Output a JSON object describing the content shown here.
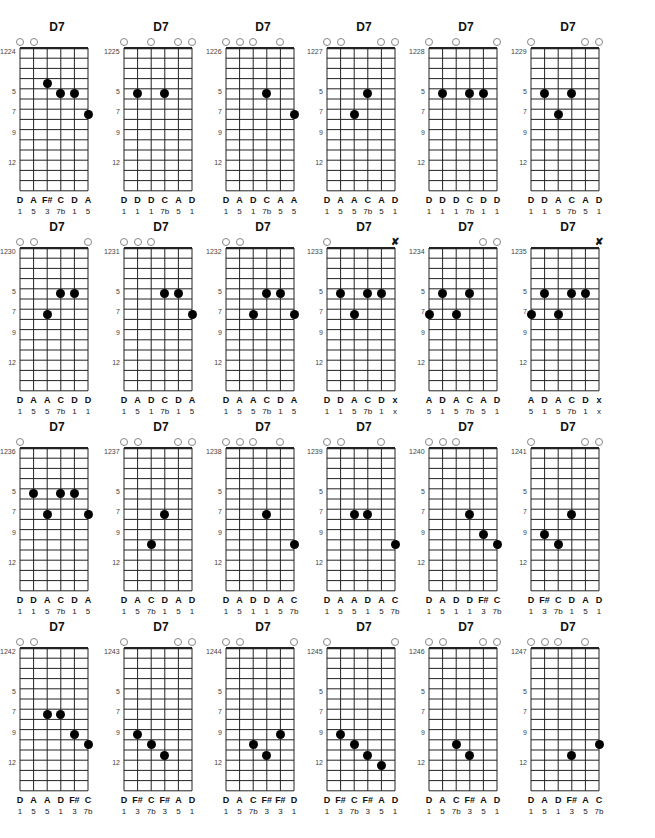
{
  "header": {
    "title": ""
  },
  "layout": {
    "columns_x": [
      30,
      134,
      236,
      337,
      439,
      541
    ],
    "rows_y": [
      20,
      220,
      420,
      620
    ],
    "string_spacing": 13.6,
    "fret_height": 10.2,
    "fret_rows": 14,
    "fret_markers": [
      5,
      7,
      9,
      12
    ]
  },
  "chords": [
    {
      "id": "1224",
      "name": "D7",
      "open": [
        1,
        2
      ],
      "muted": [],
      "dots": [
        {
          "s": 3,
          "f": 4
        },
        {
          "s": 4,
          "f": 5
        },
        {
          "s": 5,
          "f": 5
        },
        {
          "s": 6,
          "f": 7
        }
      ],
      "notes": [
        "D",
        "A",
        "F#",
        "C",
        "D",
        "A"
      ],
      "degrees": [
        "1",
        "5",
        "3",
        "7b",
        "1",
        "5"
      ]
    },
    {
      "id": "1225",
      "name": "D7",
      "open": [
        1,
        3,
        5,
        6
      ],
      "muted": [],
      "dots": [
        {
          "s": 2,
          "f": 5
        },
        {
          "s": 4,
          "f": 5
        }
      ],
      "notes": [
        "D",
        "D",
        "D",
        "C",
        "A",
        "D"
      ],
      "degrees": [
        "1",
        "1",
        "1",
        "7b",
        "5",
        "1"
      ]
    },
    {
      "id": "1226",
      "name": "D7",
      "open": [
        1,
        2,
        3,
        5
      ],
      "muted": [],
      "dots": [
        {
          "s": 4,
          "f": 5
        },
        {
          "s": 6,
          "f": 7
        }
      ],
      "notes": [
        "D",
        "A",
        "D",
        "C",
        "A",
        "A"
      ],
      "degrees": [
        "1",
        "5",
        "1",
        "7b",
        "5",
        "5"
      ]
    },
    {
      "id": "1227",
      "name": "D7",
      "open": [
        1,
        2,
        5,
        6
      ],
      "muted": [],
      "dots": [
        {
          "s": 4,
          "f": 5
        },
        {
          "s": 3,
          "f": 7
        }
      ],
      "notes": [
        "D",
        "A",
        "A",
        "C",
        "A",
        "D"
      ],
      "degrees": [
        "1",
        "5",
        "5",
        "7b",
        "5",
        "1"
      ]
    },
    {
      "id": "1228",
      "name": "D7",
      "open": [
        1,
        3,
        6
      ],
      "muted": [],
      "dots": [
        {
          "s": 2,
          "f": 5
        },
        {
          "s": 4,
          "f": 5
        },
        {
          "s": 5,
          "f": 5
        }
      ],
      "notes": [
        "D",
        "D",
        "D",
        "C",
        "D",
        "D"
      ],
      "degrees": [
        "1",
        "1",
        "1",
        "7b",
        "1",
        "1"
      ]
    },
    {
      "id": "1229",
      "name": "D7",
      "open": [
        1,
        5,
        6
      ],
      "muted": [],
      "dots": [
        {
          "s": 2,
          "f": 5
        },
        {
          "s": 4,
          "f": 5
        },
        {
          "s": 3,
          "f": 7
        }
      ],
      "notes": [
        "D",
        "D",
        "A",
        "C",
        "A",
        "D"
      ],
      "degrees": [
        "1",
        "1",
        "5",
        "7b",
        "5",
        "1"
      ]
    },
    {
      "id": "1230",
      "name": "D7",
      "open": [
        1,
        2,
        6
      ],
      "muted": [],
      "dots": [
        {
          "s": 4,
          "f": 5
        },
        {
          "s": 5,
          "f": 5
        },
        {
          "s": 3,
          "f": 7
        }
      ],
      "notes": [
        "D",
        "A",
        "A",
        "C",
        "D",
        "D"
      ],
      "degrees": [
        "1",
        "5",
        "5",
        "7b",
        "1",
        "1"
      ]
    },
    {
      "id": "1231",
      "name": "D7",
      "open": [
        1,
        2,
        3
      ],
      "muted": [],
      "dots": [
        {
          "s": 4,
          "f": 5
        },
        {
          "s": 5,
          "f": 5
        },
        {
          "s": 6,
          "f": 7
        }
      ],
      "notes": [
        "D",
        "A",
        "D",
        "C",
        "D",
        "A"
      ],
      "degrees": [
        "1",
        "5",
        "1",
        "7b",
        "1",
        "5"
      ]
    },
    {
      "id": "1232",
      "name": "D7",
      "open": [
        1,
        2
      ],
      "muted": [],
      "dots": [
        {
          "s": 4,
          "f": 5
        },
        {
          "s": 5,
          "f": 5
        },
        {
          "s": 3,
          "f": 7
        },
        {
          "s": 6,
          "f": 7
        }
      ],
      "notes": [
        "D",
        "A",
        "A",
        "C",
        "D",
        "A"
      ],
      "degrees": [
        "1",
        "5",
        "5",
        "7b",
        "1",
        "5"
      ]
    },
    {
      "id": "1233",
      "name": "D7",
      "open": [
        1
      ],
      "muted": [
        6
      ],
      "dots": [
        {
          "s": 2,
          "f": 5
        },
        {
          "s": 4,
          "f": 5
        },
        {
          "s": 5,
          "f": 5
        },
        {
          "s": 3,
          "f": 7
        }
      ],
      "notes": [
        "D",
        "D",
        "A",
        "C",
        "D",
        "x"
      ],
      "degrees": [
        "1",
        "1",
        "5",
        "7b",
        "1",
        "x"
      ]
    },
    {
      "id": "1234",
      "name": "D7",
      "open": [
        5,
        6
      ],
      "muted": [],
      "dots": [
        {
          "s": 2,
          "f": 5
        },
        {
          "s": 4,
          "f": 5
        },
        {
          "s": 1,
          "f": 7
        },
        {
          "s": 3,
          "f": 7
        }
      ],
      "notes": [
        "A",
        "D",
        "A",
        "C",
        "A",
        "D"
      ],
      "degrees": [
        "5",
        "1",
        "5",
        "7b",
        "5",
        "1"
      ]
    },
    {
      "id": "1235",
      "name": "D7",
      "open": [],
      "muted": [
        6
      ],
      "dots": [
        {
          "s": 2,
          "f": 5
        },
        {
          "s": 4,
          "f": 5
        },
        {
          "s": 5,
          "f": 5
        },
        {
          "s": 1,
          "f": 7
        },
        {
          "s": 3,
          "f": 7
        }
      ],
      "notes": [
        "A",
        "D",
        "A",
        "C",
        "D",
        "x"
      ],
      "degrees": [
        "5",
        "1",
        "5",
        "7b",
        "1",
        "x"
      ]
    },
    {
      "id": "1236",
      "name": "D7",
      "open": [
        1
      ],
      "muted": [],
      "dots": [
        {
          "s": 2,
          "f": 5
        },
        {
          "s": 4,
          "f": 5
        },
        {
          "s": 5,
          "f": 5
        },
        {
          "s": 3,
          "f": 7
        },
        {
          "s": 6,
          "f": 7
        }
      ],
      "notes": [
        "D",
        "D",
        "A",
        "C",
        "D",
        "A"
      ],
      "degrees": [
        "1",
        "1",
        "5",
        "7b",
        "1",
        "5"
      ]
    },
    {
      "id": "1237",
      "name": "D7",
      "open": [
        1,
        2,
        5,
        6
      ],
      "muted": [],
      "dots": [
        {
          "s": 4,
          "f": 7
        },
        {
          "s": 3,
          "f": 10
        }
      ],
      "notes": [
        "D",
        "A",
        "C",
        "D",
        "A",
        "D"
      ],
      "degrees": [
        "1",
        "5",
        "7b",
        "1",
        "5",
        "1"
      ]
    },
    {
      "id": "1238",
      "name": "D7",
      "open": [
        1,
        2,
        3,
        5
      ],
      "muted": [],
      "dots": [
        {
          "s": 4,
          "f": 7
        },
        {
          "s": 6,
          "f": 10
        }
      ],
      "notes": [
        "D",
        "A",
        "D",
        "D",
        "A",
        "C"
      ],
      "degrees": [
        "1",
        "5",
        "1",
        "1",
        "5",
        "7b"
      ]
    },
    {
      "id": "1239",
      "name": "D7",
      "open": [
        1,
        2,
        5
      ],
      "muted": [],
      "dots": [
        {
          "s": 3,
          "f": 7
        },
        {
          "s": 4,
          "f": 7
        },
        {
          "s": 6,
          "f": 10
        }
      ],
      "notes": [
        "D",
        "A",
        "A",
        "D",
        "A",
        "C"
      ],
      "degrees": [
        "1",
        "5",
        "5",
        "1",
        "5",
        "7b"
      ]
    },
    {
      "id": "1240",
      "name": "D7",
      "open": [
        1,
        2,
        3
      ],
      "muted": [],
      "dots": [
        {
          "s": 4,
          "f": 7
        },
        {
          "s": 5,
          "f": 9
        },
        {
          "s": 6,
          "f": 10
        }
      ],
      "notes": [
        "D",
        "A",
        "D",
        "D",
        "F#",
        "C"
      ],
      "degrees": [
        "1",
        "5",
        "1",
        "1",
        "3",
        "7b"
      ]
    },
    {
      "id": "1241",
      "name": "D7",
      "open": [
        1,
        5,
        6
      ],
      "muted": [],
      "dots": [
        {
          "s": 4,
          "f": 7
        },
        {
          "s": 2,
          "f": 9
        },
        {
          "s": 3,
          "f": 10
        }
      ],
      "notes": [
        "D",
        "F#",
        "C",
        "D",
        "A",
        "D"
      ],
      "degrees": [
        "1",
        "3",
        "7b",
        "1",
        "5",
        "1"
      ]
    },
    {
      "id": "1242",
      "name": "D7",
      "open": [
        1,
        2
      ],
      "muted": [],
      "dots": [
        {
          "s": 3,
          "f": 7
        },
        {
          "s": 4,
          "f": 7
        },
        {
          "s": 5,
          "f": 9
        },
        {
          "s": 6,
          "f": 10
        }
      ],
      "notes": [
        "D",
        "A",
        "A",
        "D",
        "F#",
        "C"
      ],
      "degrees": [
        "1",
        "5",
        "5",
        "1",
        "3",
        "7b"
      ]
    },
    {
      "id": "1243",
      "name": "D7",
      "open": [
        1,
        5,
        6
      ],
      "muted": [],
      "dots": [
        {
          "s": 2,
          "f": 9
        },
        {
          "s": 3,
          "f": 10
        },
        {
          "s": 4,
          "f": 11
        }
      ],
      "notes": [
        "D",
        "F#",
        "C",
        "F#",
        "A",
        "D"
      ],
      "degrees": [
        "1",
        "3",
        "7b",
        "3",
        "5",
        "1"
      ]
    },
    {
      "id": "1244",
      "name": "D7",
      "open": [
        1,
        2,
        6
      ],
      "muted": [],
      "dots": [
        {
          "s": 5,
          "f": 9
        },
        {
          "s": 3,
          "f": 10
        },
        {
          "s": 4,
          "f": 11
        }
      ],
      "notes": [
        "D",
        "A",
        "C",
        "F#",
        "F#",
        "D"
      ],
      "degrees": [
        "1",
        "5",
        "7b",
        "3",
        "3",
        "1"
      ]
    },
    {
      "id": "1245",
      "name": "D7",
      "open": [
        1,
        6
      ],
      "muted": [],
      "dots": [
        {
          "s": 2,
          "f": 9
        },
        {
          "s": 3,
          "f": 10
        },
        {
          "s": 4,
          "f": 11
        },
        {
          "s": 5,
          "f": 12
        }
      ],
      "notes": [
        "D",
        "F#",
        "C",
        "F#",
        "A",
        "D"
      ],
      "degrees": [
        "1",
        "3",
        "7b",
        "3",
        "5",
        "1"
      ]
    },
    {
      "id": "1246",
      "name": "D7",
      "open": [
        1,
        2,
        5,
        6
      ],
      "muted": [],
      "dots": [
        {
          "s": 3,
          "f": 10
        },
        {
          "s": 4,
          "f": 11
        }
      ],
      "notes": [
        "D",
        "A",
        "C",
        "F#",
        "A",
        "D"
      ],
      "degrees": [
        "1",
        "5",
        "7b",
        "3",
        "5",
        "1"
      ]
    },
    {
      "id": "1247",
      "name": "D7",
      "open": [
        1,
        2,
        3,
        5
      ],
      "muted": [],
      "dots": [
        {
          "s": 6,
          "f": 10
        },
        {
          "s": 4,
          "f": 11
        }
      ],
      "notes": [
        "D",
        "A",
        "D",
        "F#",
        "A",
        "C"
      ],
      "degrees": [
        "1",
        "5",
        "1",
        "3",
        "5",
        "7b"
      ]
    }
  ]
}
